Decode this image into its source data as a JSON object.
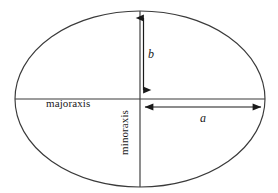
{
  "figure": {
    "type": "geometry-diagram",
    "background_color": "#ffffff",
    "stroke_color": "#333333",
    "text_color": "#1a1a1a",
    "width": 278,
    "height": 193
  },
  "labels": {
    "major_axis": "majoraxis",
    "minor_axis": "minoraxis",
    "semi_minor": "b",
    "semi_major": "a"
  },
  "geometry": {
    "center": {
      "x": 140,
      "y": 99
    },
    "semi_major_axis_px": 125,
    "semi_minor_axis_px": 88,
    "major_axis_line": {
      "x1": 15,
      "y1": 99,
      "x2": 265,
      "y2": 99
    },
    "minor_axis_line": {
      "x1": 140,
      "y1": 11,
      "x2": 140,
      "y2": 187
    },
    "b_arrow": {
      "x": 143,
      "y_top": 18,
      "y_bottom": 90,
      "heads": "both"
    },
    "a_arrow": {
      "y": 107,
      "x_left": 144,
      "x_right": 262,
      "heads": "both"
    }
  }
}
